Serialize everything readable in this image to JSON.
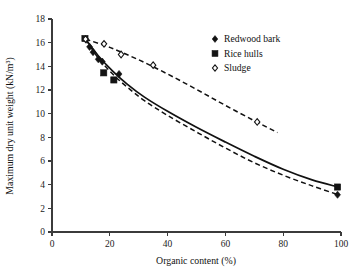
{
  "chart_data": {
    "type": "scatter",
    "title": "",
    "xlabel": "Organic content (%)",
    "ylabel": "Maximum dry unit weight (kN/m3)",
    "ylabel_display": "Maximum dry unit weight (kN/m³)",
    "xlim": [
      0,
      100
    ],
    "ylim": [
      0,
      18
    ],
    "xticks": [
      0,
      20,
      40,
      60,
      80,
      100
    ],
    "yticks": [
      0,
      2,
      4,
      6,
      8,
      10,
      12,
      14,
      16,
      18
    ],
    "grid": false,
    "legend_position": "top-right",
    "series": [
      {
        "name": "Redwood bark",
        "marker": "filled-diamond",
        "color": "#131313",
        "points": [
          {
            "x": 11.8,
            "y": 16.25
          },
          {
            "x": 13.0,
            "y": 15.65
          },
          {
            "x": 14.2,
            "y": 15.2
          },
          {
            "x": 16.0,
            "y": 14.6
          },
          {
            "x": 17.4,
            "y": 14.4
          },
          {
            "x": 23.2,
            "y": 13.35
          },
          {
            "x": 98.8,
            "y": 3.15
          }
        ]
      },
      {
        "name": "Rice hulls",
        "marker": "filled-square",
        "color": "#131313",
        "points": [
          {
            "x": 11.4,
            "y": 16.35
          },
          {
            "x": 17.9,
            "y": 13.45
          },
          {
            "x": 21.4,
            "y": 12.85
          },
          {
            "x": 98.8,
            "y": 3.8
          }
        ]
      },
      {
        "name": "Sludge",
        "marker": "open-diamond",
        "color": "#131313",
        "points": [
          {
            "x": 11.6,
            "y": 16.3
          },
          {
            "x": 18.0,
            "y": 15.9
          },
          {
            "x": 23.9,
            "y": 15.0
          },
          {
            "x": 35.0,
            "y": 14.1
          },
          {
            "x": 71.0,
            "y": 9.3
          }
        ]
      }
    ],
    "curves": [
      {
        "name": "redwood-bark-trend",
        "style": "solid",
        "points": [
          {
            "x": 11.6,
            "y": 16.3
          },
          {
            "x": 16.0,
            "y": 14.9
          },
          {
            "x": 21.0,
            "y": 13.6
          },
          {
            "x": 26.0,
            "y": 12.5
          },
          {
            "x": 32.0,
            "y": 11.4
          },
          {
            "x": 40.0,
            "y": 10.2
          },
          {
            "x": 50.0,
            "y": 8.85
          },
          {
            "x": 60.0,
            "y": 7.6
          },
          {
            "x": 70.0,
            "y": 6.4
          },
          {
            "x": 80.0,
            "y": 5.3
          },
          {
            "x": 90.0,
            "y": 4.4
          },
          {
            "x": 99.0,
            "y": 3.8
          }
        ]
      },
      {
        "name": "rice-hulls-trend",
        "style": "dashed",
        "points": [
          {
            "x": 11.6,
            "y": 16.3
          },
          {
            "x": 16.0,
            "y": 14.7
          },
          {
            "x": 21.0,
            "y": 13.35
          },
          {
            "x": 26.0,
            "y": 12.25
          },
          {
            "x": 32.0,
            "y": 11.1
          },
          {
            "x": 40.0,
            "y": 9.85
          },
          {
            "x": 50.0,
            "y": 8.45
          },
          {
            "x": 60.0,
            "y": 7.1
          },
          {
            "x": 70.0,
            "y": 5.85
          },
          {
            "x": 80.0,
            "y": 4.8
          },
          {
            "x": 90.0,
            "y": 3.9
          },
          {
            "x": 99.0,
            "y": 3.15
          }
        ]
      },
      {
        "name": "sludge-trend",
        "style": "dashed",
        "points": [
          {
            "x": 11.6,
            "y": 16.3
          },
          {
            "x": 20.0,
            "y": 15.6
          },
          {
            "x": 30.0,
            "y": 14.55
          },
          {
            "x": 40.0,
            "y": 13.35
          },
          {
            "x": 50.0,
            "y": 12.05
          },
          {
            "x": 60.0,
            "y": 10.7
          },
          {
            "x": 70.0,
            "y": 9.4
          },
          {
            "x": 78.0,
            "y": 8.4
          }
        ]
      }
    ]
  },
  "axes": {
    "x_tick_labels": [
      "0",
      "20",
      "40",
      "60",
      "80",
      "100"
    ],
    "y_tick_labels": [
      "0",
      "2",
      "4",
      "6",
      "8",
      "10",
      "12",
      "14",
      "16",
      "18"
    ],
    "x_title": "Organic content (%)",
    "y_title": "Maximum dry unit weight (kN/m³)"
  },
  "legend": {
    "entries": [
      {
        "label": "Redwood bark",
        "marker": "filled-diamond"
      },
      {
        "label": "Rice hulls",
        "marker": "filled-square"
      },
      {
        "label": "Sludge",
        "marker": "open-diamond"
      }
    ]
  },
  "colors": {
    "ink": "#131313",
    "axis": "#3b3b3b",
    "background": "#ffffff"
  }
}
